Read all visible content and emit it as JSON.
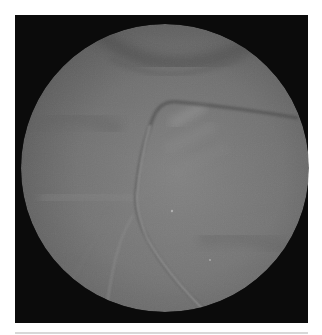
{
  "image": {
    "type": "fundus-photograph",
    "mode": "grayscale",
    "frame_color": "#0b0b0b",
    "background_color": "#ffffff",
    "disc": {
      "cx": 165,
      "cy": 168,
      "r": 144,
      "base_color": "#6e6e6e",
      "center_color": "#7c7c7c",
      "edge_color": "#555555"
    },
    "features": [
      {
        "name": "upper-arc-shadow",
        "description": "darker curved band near top of fundus"
      },
      {
        "name": "main-vessel",
        "description": "light vessel curving from upper-right across center down to bottom"
      },
      {
        "name": "branch-vessel",
        "description": "faint vessel branching toward lower-left"
      },
      {
        "name": "bright-reflex",
        "description": "lighter diagonal streaks at upper center"
      }
    ]
  }
}
